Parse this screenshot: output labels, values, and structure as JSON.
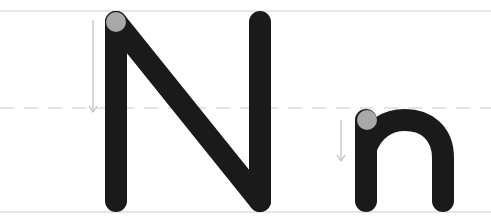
{
  "letters": [
    {
      "glyph": "N",
      "case": "uppercase",
      "stroke_count": 3
    },
    {
      "glyph": "n",
      "case": "lowercase",
      "stroke_count": 2
    }
  ],
  "guides": {
    "top_line": "solid",
    "mid_line": "dashed",
    "base_line": "solid"
  },
  "colors": {
    "stroke": "#1a1a1a",
    "start_dot": "#a8a8a8",
    "guide_line": "#c8c8c8",
    "arrow": "#bdbdbd",
    "background": "#ffffff"
  }
}
